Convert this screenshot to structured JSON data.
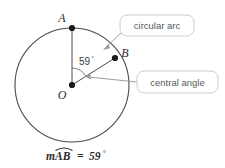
{
  "figure": {
    "points": [
      {
        "id": "A",
        "label": "A",
        "x": 72,
        "y": 28
      },
      {
        "id": "B",
        "label": "B",
        "x": 115,
        "y": 58
      },
      {
        "id": "O",
        "label": "O",
        "x": 72,
        "y": 85
      }
    ],
    "circle": {
      "cx": 72,
      "cy": 85,
      "r": 57
    },
    "angle": {
      "value": "59",
      "degree_symbol": "°",
      "label": "59°"
    },
    "callouts": [
      {
        "id": "circular-arc",
        "label": "circular arc"
      },
      {
        "id": "central-angle",
        "label": "central angle"
      }
    ],
    "caption": {
      "m": "m",
      "arc_name": "AB",
      "equals": "=",
      "value": "59",
      "degree_symbol": "°",
      "full": "mAB = 59°"
    },
    "colors": {
      "stroke": "#4a4a4a",
      "point": "#1a1a1a",
      "callout_border": "#c9ccd0",
      "callout_text": "#555a5e",
      "leader": "#9a9ea2",
      "background": "#ffffff"
    }
  }
}
